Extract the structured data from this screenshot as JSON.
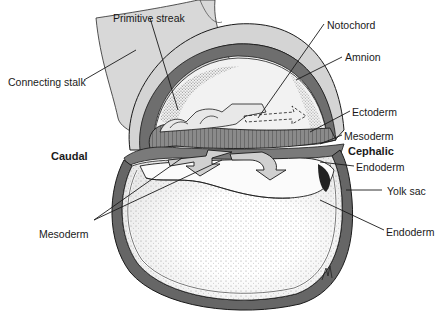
{
  "diagram": {
    "orientation": {
      "caudal": "Caudal",
      "cephalic": "Cephalic"
    },
    "labels": {
      "primitive_streak": "Primitive streak",
      "connecting_stalk": "Connecting stalk",
      "notochord": "Notochord",
      "amnion": "Amnion",
      "ectoderm": "Ectoderm",
      "mesoderm_right": "Mesoderm",
      "endoderm_upper": "Endoderm",
      "yolk_sac": "Yolk sac",
      "endoderm_lower": "Endoderm",
      "mesoderm_left": "Mesoderm"
    },
    "signature": "M"
  },
  "colors": {
    "outline": "#1a1a1a",
    "layer_dark": "#6e6e6e",
    "layer_mid": "#9a9a9a",
    "stalk": "#d6d6d6",
    "stipple": "#8c8c8c",
    "background": "#ffffff"
  }
}
